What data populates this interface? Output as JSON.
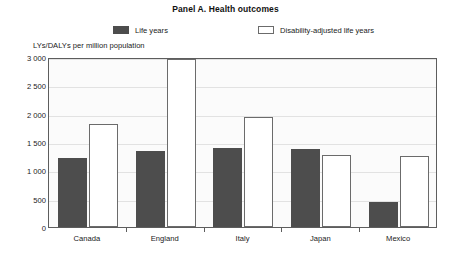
{
  "panel": {
    "title": "Panel A. Health outcomes"
  },
  "legend": {
    "items": [
      {
        "label": "Life years",
        "style": "filled",
        "color": "#4d4d4d",
        "icon": "square-filled-icon"
      },
      {
        "label": "Disability-adjusted life years",
        "style": "hollow",
        "color": "#ffffff",
        "icon": "square-outline-icon"
      }
    ]
  },
  "chart_data": {
    "type": "bar",
    "title": "Panel A. Health outcomes",
    "subtitle": "",
    "xlabel": "",
    "ylabel": "LYs/DALYs per million population",
    "categories": [
      "Canada",
      "England",
      "Italy",
      "Japan",
      "Mexico"
    ],
    "series": [
      {
        "name": "Life years",
        "color": "#4d4d4d",
        "values": [
          1210,
          1340,
          1400,
          1370,
          440
        ]
      },
      {
        "name": "Disability-adjusted life years",
        "color": "#ffffff",
        "values": [
          1815,
          2960,
          1950,
          1265,
          1260
        ]
      }
    ],
    "ylim": [
      0,
      3000
    ],
    "yticks": [
      0,
      500,
      1000,
      1500,
      2000,
      2500,
      3000
    ],
    "ytick_labels": [
      "0",
      "500",
      "1 000",
      "1 500",
      "2 000",
      "2 500",
      "3 000"
    ],
    "grid": true,
    "grid_axis": "y",
    "legend_position": "top"
  }
}
